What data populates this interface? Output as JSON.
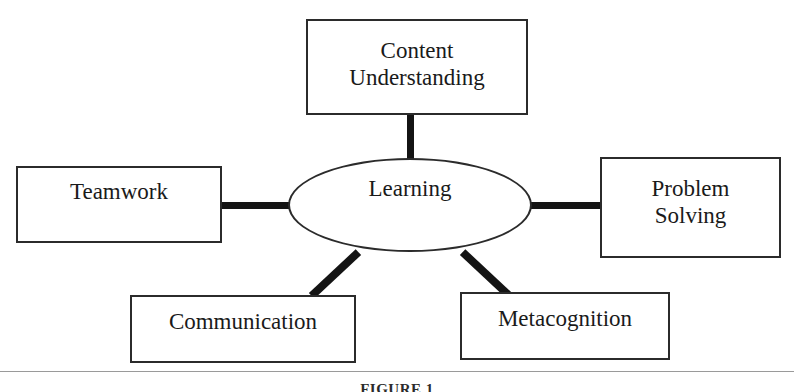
{
  "figure": {
    "caption": "FIGURE 1",
    "center": {
      "id": "learning",
      "label": "Learning",
      "shape": "ellipse"
    },
    "nodes": [
      {
        "id": "content-understanding",
        "label": "Content\nUnderstanding",
        "position": "top",
        "shape": "rectangle"
      },
      {
        "id": "teamwork",
        "label": "Teamwork",
        "position": "left",
        "shape": "rectangle"
      },
      {
        "id": "problem-solving",
        "label": "Problem\nSolving",
        "position": "right",
        "shape": "rectangle"
      },
      {
        "id": "communication",
        "label": "Communication",
        "position": "bottom-left",
        "shape": "rectangle"
      },
      {
        "id": "metacognition",
        "label": "Metacognition",
        "position": "bottom-right",
        "shape": "rectangle"
      }
    ],
    "connectors": [
      {
        "from": "learning",
        "to": "content-understanding",
        "orientation": "vertical"
      },
      {
        "from": "learning",
        "to": "teamwork",
        "orientation": "horizontal"
      },
      {
        "from": "learning",
        "to": "problem-solving",
        "orientation": "horizontal"
      },
      {
        "from": "learning",
        "to": "communication",
        "orientation": "diagonal"
      },
      {
        "from": "learning",
        "to": "metacognition",
        "orientation": "diagonal"
      }
    ],
    "colors": {
      "background": "#ffffff",
      "stroke": "#2b2b2b",
      "connector": "#141414",
      "text": "#1a1a1a"
    }
  }
}
